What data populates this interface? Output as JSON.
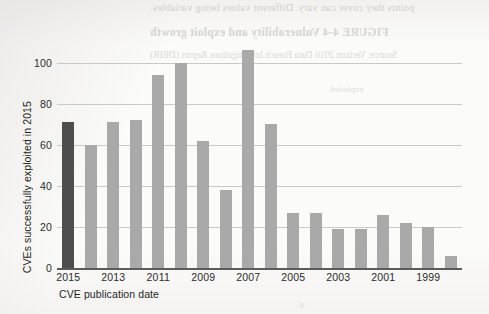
{
  "chart_data": {
    "type": "bar",
    "title": "",
    "xlabel": "CVE publication date",
    "ylabel": "CVEs successfully exploited in 2015",
    "categories": [
      "2015",
      "2014",
      "2013",
      "2012",
      "2011",
      "2010",
      "2009",
      "2008",
      "2007",
      "2006",
      "2005",
      "2004",
      "2003",
      "2002",
      "2001",
      "2000",
      "1999",
      "1998"
    ],
    "values": [
      71,
      60,
      71,
      72,
      94,
      100,
      62,
      38,
      106,
      70,
      27,
      27,
      19,
      19,
      26,
      22,
      20,
      6
    ],
    "highlight_index": 0,
    "highlight_color": "#4e4e4e",
    "bar_color": "#a9a9a9",
    "ylim": [
      0,
      113
    ],
    "yticks": [
      0,
      20,
      40,
      60,
      80,
      100
    ],
    "ytick_labels": [
      "0",
      "20",
      "40",
      "60",
      "80",
      "100"
    ],
    "xtick_labels": [
      "2015",
      "2013",
      "2011",
      "2009",
      "2007",
      "2005",
      "2003",
      "2001",
      "1999"
    ],
    "xtick_indices": [
      0,
      2,
      4,
      6,
      8,
      10,
      12,
      14,
      16
    ],
    "grid": true,
    "grid_axis": "y",
    "grid_color": "#c9c9c9",
    "legend": "none"
  },
  "page_bleed": {
    "line_1": "points they cover can vary. Different values being variables.",
    "line_2": "FIGURE 4-4   Vulnerability and exploit growth",
    "line_3": "Source: Verizon 2016 Data Breach Investigations Report (DBIR)",
    "line_4": "exploited",
    "line_5": "4"
  }
}
